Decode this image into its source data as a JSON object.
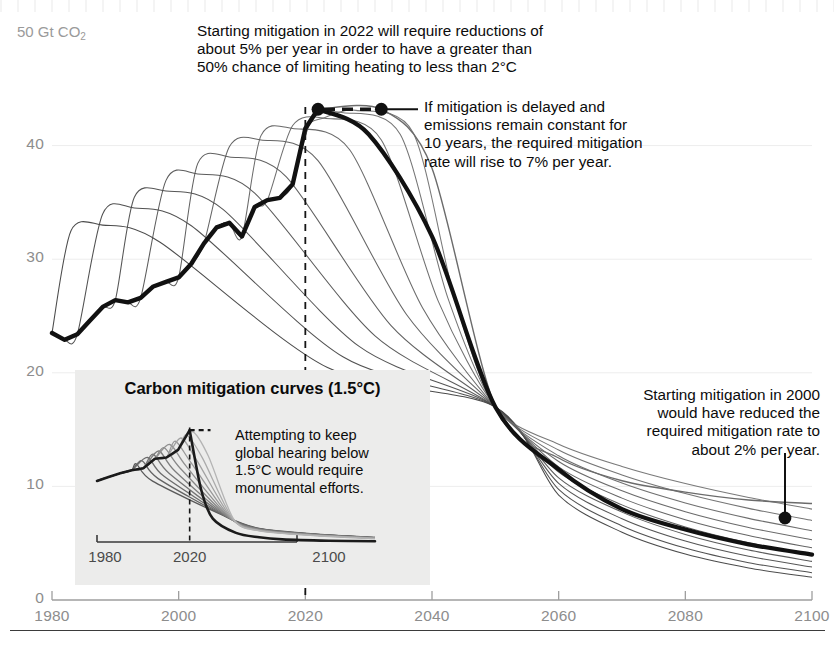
{
  "chart_data": {
    "type": "line",
    "title": "",
    "xlabel": "",
    "ylabel": "Gt CO2",
    "unit_label": "50 Gt CO",
    "unit_sub": "2",
    "xlim": [
      1980,
      2100
    ],
    "ylim": [
      0,
      50
    ],
    "xticks": [
      "1980",
      "2000",
      "2020",
      "2040",
      "2060",
      "2080",
      "2100"
    ],
    "xtick_values": [
      1980,
      2000,
      2020,
      2040,
      2060,
      2080,
      2100
    ],
    "yticks": [
      "0",
      "10",
      "20",
      "30",
      "40"
    ],
    "ytick_values": [
      0,
      10,
      20,
      30,
      40
    ],
    "grid": false,
    "legend": "none",
    "series": [
      {
        "name": "Historical emissions",
        "style": "thick-black",
        "x": [
          1980,
          1982,
          1984,
          1986,
          1988,
          1990,
          1992,
          1994,
          1996,
          1998,
          2000,
          2002,
          2004,
          2006,
          2008,
          2010,
          2012,
          2014,
          2016,
          2018,
          2020,
          2022
        ],
        "values": [
          23.5,
          22.9,
          23.4,
          24.6,
          25.8,
          26.4,
          26.2,
          26.6,
          27.6,
          28.0,
          28.4,
          29.6,
          31.4,
          32.8,
          33.2,
          32.0,
          34.6,
          35.2,
          35.4,
          36.6,
          41.5,
          43.2
        ]
      },
      {
        "name": "Mitigation pathway starting 2022 (5% per year)",
        "style": "thick-black",
        "x": [
          2022,
          2030,
          2040,
          2050,
          2060,
          2070,
          2080,
          2090,
          2100
        ],
        "values": [
          43.2,
          41.0,
          32.0,
          17.0,
          11.5,
          8.0,
          6.2,
          4.9,
          4.0
        ]
      },
      {
        "name": "Delayed mitigation, constant emissions 10 years (7% per year)",
        "style": "thin-grey",
        "x": [
          2022,
          2032,
          2040,
          2050,
          2060,
          2070,
          2080,
          2090,
          2100
        ],
        "values": [
          43.2,
          43.2,
          38.0,
          17.0,
          12.5,
          10.5,
          9.5,
          8.8,
          8.5
        ]
      },
      {
        "name": "Earlier-start mitigation family (fan of thin grey curves)",
        "style": "thin-grey-fan",
        "start_years": [
          1980,
          1985,
          1990,
          1995,
          2000,
          2005,
          2010,
          2015,
          2018,
          2020
        ],
        "peak_values": [
          33.0,
          34.5,
          36.0,
          37.5,
          39.0,
          40.5,
          41.5,
          42.4,
          42.9,
          43.1
        ],
        "convergence_year": 2050,
        "convergence_value": 17.0,
        "values_2100": [
          2.0,
          2.4,
          2.9,
          3.4,
          4.0,
          4.6,
          5.3,
          6.1,
          7.0,
          8.0
        ]
      }
    ],
    "markers": [
      {
        "name": "peak-2022-marker",
        "x": 2022,
        "y": 43.2
      },
      {
        "name": "delayed-2032-marker",
        "x": 2032,
        "y": 43.2
      },
      {
        "name": "year-2100-marker",
        "x": 2098,
        "y": 8.5
      }
    ],
    "reference_lines": [
      {
        "name": "vertical-2020-dashed",
        "orientation": "vertical",
        "x": 2020,
        "style": "dashed"
      },
      {
        "name": "horizontal-peak-dashed",
        "orientation": "horizontal",
        "y": 43.2,
        "x_from": 2022,
        "x_to": 2032,
        "style": "dashed"
      }
    ]
  },
  "annotations": {
    "top": "Starting mitigation in 2022 will require reductions of\nabout 5% per year in order to have a greater than\n50% chance of limiting heating to less than 2°C",
    "right": "If mitigation is delayed and\nemissions remain constant for\n10 years, the required mitigation\nrate will rise to 7% per year.",
    "bottom_right": "Starting mitigation in 2000\nwould have reduced the\nrequired mitigation rate to\nabout 2% per year."
  },
  "inset": {
    "title": "Carbon mitigation curves (1.5°C)",
    "annotation": "Attempting to keep\nglobal hearing below\n1.5°C would require\nmonumental efforts.",
    "xticks": [
      "1980",
      "2020",
      "2100"
    ],
    "chart_data": {
      "type": "line",
      "xlim": [
        1980,
        2100
      ],
      "ylim": [
        0,
        50
      ],
      "series": [
        {
          "name": "Historical emissions (inset)",
          "x": [
            1980,
            1985,
            1990,
            1995,
            2000,
            2005,
            2010,
            2015,
            2020
          ],
          "values": [
            23.5,
            25.0,
            26.4,
            27.6,
            28.4,
            32.0,
            32.5,
            35.4,
            43.0
          ]
        },
        {
          "name": "1.5C mitigation pathway (inset)",
          "x": [
            2020,
            2025,
            2030,
            2040,
            2050,
            2060,
            2080,
            2100
          ],
          "values": [
            43.0,
            20.0,
            9.0,
            3.5,
            1.8,
            1.0,
            0.5,
            0.3
          ]
        }
      ],
      "reference_lines": [
        {
          "name": "inset-vertical-2020-dashed",
          "orientation": "vertical",
          "x": 2020,
          "style": "dashed"
        },
        {
          "name": "inset-horizontal-peak-dashed",
          "orientation": "horizontal",
          "y": 43.0,
          "style": "dashed"
        }
      ]
    }
  },
  "colors": {
    "axis_text": "#8d8d8d",
    "annotation_text": "#0c0c0c",
    "curve_main": "#111111",
    "curve_fan": "#6f6f6f",
    "inset_background": "#ececeb",
    "rule": "#3b3b3b"
  }
}
